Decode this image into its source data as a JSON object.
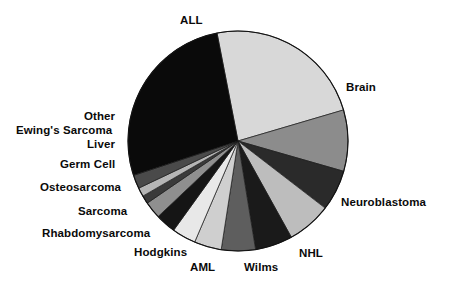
{
  "chart_data": {
    "type": "pie",
    "title": "",
    "subtitle": "",
    "xlabel": "",
    "ylabel": "",
    "legend_position": "none",
    "grid": false,
    "labels_placement": "outside-radial",
    "center": {
      "x": 238,
      "y": 141
    },
    "radius": 110,
    "start_angle_deg": -11,
    "direction": "clockwise",
    "categories": [
      "Brain",
      "Neuroblastoma",
      "NHL",
      "Wilms",
      "AML",
      "Hodgkins",
      "Rhabdomysarcoma",
      "Sarcoma",
      "Osteosarcoma",
      "Germ Cell",
      "Liver",
      "Ewing's Sarcoma",
      "Other",
      "ALL"
    ],
    "values": [
      23.5,
      9.0,
      6.0,
      6.5,
      5.5,
      5.0,
      4.0,
      3.5,
      3.0,
      2.5,
      1.2,
      1.3,
      2.0,
      27.0
    ],
    "colors": [
      "#d8d8d8",
      "#8c8c8c",
      "#2a2a2a",
      "#bdbdbd",
      "#1a1a1a",
      "#5e5e5e",
      "#cfcfcf",
      "#e8e8e8",
      "#151515",
      "#8f8f8f",
      "#3a3a3a",
      "#b5b5b5",
      "#4a4a4a",
      "#0a0a0a"
    ],
    "slices": [
      {
        "label": "Brain",
        "value": 23.5,
        "color": "#d8d8d8",
        "label_side": "right"
      },
      {
        "label": "Neuroblastoma",
        "value": 9.0,
        "color": "#8c8c8c",
        "label_side": "right"
      },
      {
        "label": "NHL",
        "value": 6.0,
        "color": "#2a2a2a",
        "label_side": "bottom"
      },
      {
        "label": "Wilms",
        "value": 6.5,
        "color": "#bdbdbd",
        "label_side": "bottom"
      },
      {
        "label": "AML",
        "value": 5.5,
        "color": "#1a1a1a",
        "label_side": "bottom"
      },
      {
        "label": "Hodgkins",
        "value": 5.0,
        "color": "#5e5e5e",
        "label_side": "bottom"
      },
      {
        "label": "Rhabdomysarcoma",
        "value": 4.0,
        "color": "#cfcfcf",
        "label_side": "left"
      },
      {
        "label": "Sarcoma",
        "value": 3.5,
        "color": "#e8e8e8",
        "label_side": "left"
      },
      {
        "label": "Osteosarcoma",
        "value": 3.0,
        "color": "#151515",
        "label_side": "left"
      },
      {
        "label": "Germ Cell",
        "value": 2.5,
        "color": "#8f8f8f",
        "label_side": "left"
      },
      {
        "label": "Liver",
        "value": 1.2,
        "color": "#3a3a3a",
        "label_side": "left"
      },
      {
        "label": "Ewing's Sarcoma",
        "value": 1.3,
        "color": "#b5b5b5",
        "label_side": "left"
      },
      {
        "label": "Other",
        "value": 2.0,
        "color": "#4a4a4a",
        "label_side": "left"
      },
      {
        "label": "ALL",
        "value": 27.0,
        "color": "#0a0a0a",
        "label_side": "top"
      }
    ]
  },
  "labels": {
    "all": "ALL",
    "brain": "Brain",
    "neuroblastoma": "Neuroblastoma",
    "nhl": "NHL",
    "wilms": "Wilms",
    "aml": "AML",
    "hodgkins": "Hodgkins",
    "rhabdomysarcoma": "Rhabdomysarcoma",
    "sarcoma": "Sarcoma",
    "osteosarcoma": "Osteosarcoma",
    "germ_cell": "Germ Cell",
    "liver": "Liver",
    "ewings_sarcoma": "Ewing's Sarcoma",
    "other": "Other"
  }
}
